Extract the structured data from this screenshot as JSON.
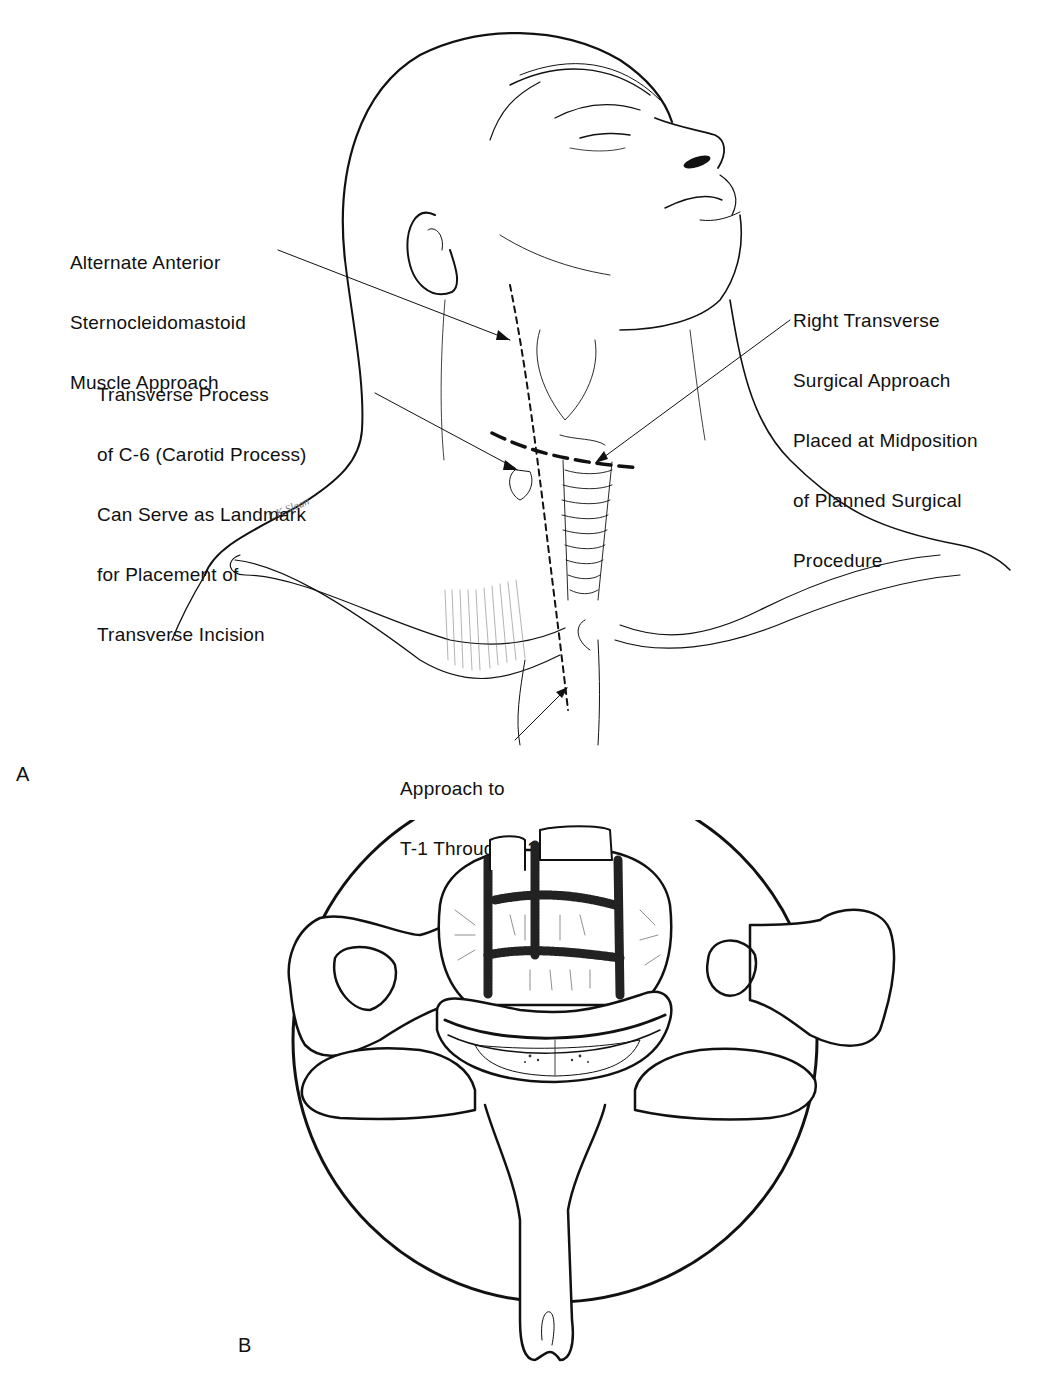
{
  "figure": {
    "panel_a": {
      "letter": "A",
      "labels": {
        "sternocleidomastoid": [
          "Alternate Anterior",
          "Sternocleidomastoid",
          "Muscle Approach"
        ],
        "transverse_process": [
          "Transverse Process",
          "of C-6 (Carotid Process)",
          "Can Serve as Landmark",
          "for Placement of",
          "Transverse Incision"
        ],
        "right_transverse": [
          "Right Transverse",
          "Surgical Approach",
          "Placed at Midposition",
          "of Planned Surgical",
          "Procedure"
        ],
        "approach_t1_t3": [
          "Approach to",
          "T-1 Through T-3"
        ]
      }
    },
    "panel_b": {
      "letter": "B"
    },
    "caption_partial": "(caption text cut off at bottom edge)"
  },
  "colors": {
    "ink": "#111111",
    "background": "#ffffff"
  }
}
